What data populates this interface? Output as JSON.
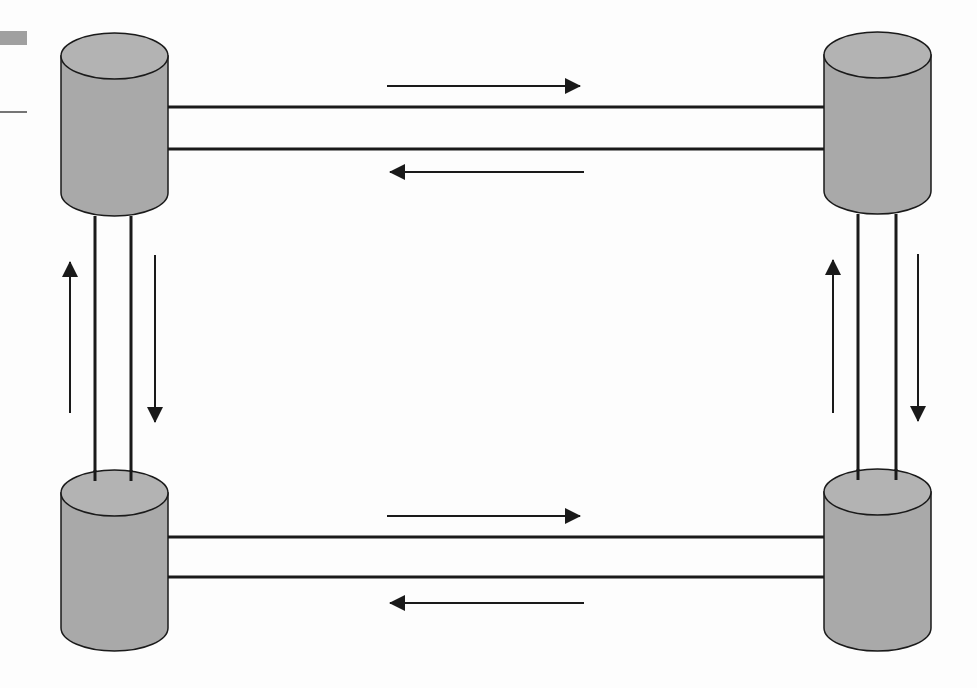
{
  "diagram": {
    "title": "",
    "colors": {
      "background": "#fdfdfd",
      "cylinder_fill": "#a9a9a9",
      "cylinder_top_fill": "#b3b3b3",
      "stroke": "#1a1a1a",
      "fragment_bar": "#a0a0a0"
    },
    "nodes": [
      {
        "id": "db-top-left",
        "label": "",
        "shape": "cylinder"
      },
      {
        "id": "db-top-right",
        "label": "",
        "shape": "cylinder"
      },
      {
        "id": "db-bottom-left",
        "label": "",
        "shape": "cylinder"
      },
      {
        "id": "db-bottom-right",
        "label": "",
        "shape": "cylinder"
      }
    ],
    "links": [
      {
        "from": "db-top-left",
        "to": "db-top-right",
        "lines": 2,
        "flows": [
          "right",
          "left"
        ]
      },
      {
        "from": "db-bottom-left",
        "to": "db-bottom-right",
        "lines": 2,
        "flows": [
          "right",
          "left"
        ]
      },
      {
        "from": "db-top-left",
        "to": "db-bottom-left",
        "lines": 2,
        "flows": [
          "up",
          "down"
        ]
      },
      {
        "from": "db-top-right",
        "to": "db-bottom-right",
        "lines": 2,
        "flows": [
          "up",
          "down"
        ]
      }
    ],
    "fragments": [
      {
        "type": "grey-bar",
        "position": "top-left-edge"
      },
      {
        "type": "thin-line",
        "position": "left-edge"
      }
    ]
  }
}
